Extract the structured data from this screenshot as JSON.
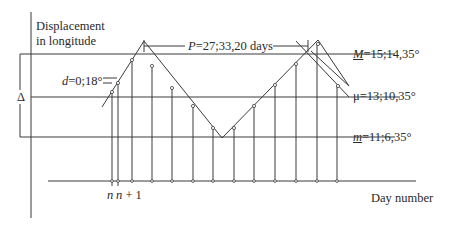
{
  "diagram": {
    "y_axis_label_line1": "Displacement",
    "y_axis_label_line2": "in longitude",
    "x_axis_label": "Day number",
    "period_label": "P=27;33,20 days",
    "period_var": "P",
    "period_value": "=27;33,20 days",
    "max_label_var": "M",
    "max_label_value": "=15;14,35°",
    "mean_label_var": "μ",
    "mean_label_value": "=13;10,35°",
    "min_label_var": "m",
    "min_label_value": "=11;6,35°",
    "difference_label_var": "d",
    "difference_label_value": "=0;18°",
    "amplitude_label": "Δ",
    "day_n_label": "n",
    "day_n1_label": "n + 1",
    "colors": {
      "line": "#3a3a3a",
      "background": "#ffffff"
    }
  }
}
